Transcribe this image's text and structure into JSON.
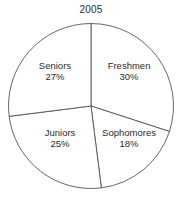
{
  "chart_data": {
    "type": "pie",
    "title": "2005",
    "xlabel": "",
    "ylabel": "",
    "legend": "none",
    "grid": false,
    "start_angle_deg": 0,
    "direction": "clockwise",
    "categories": [
      "Freshmen",
      "Sophomores",
      "Juniors",
      "Seniors"
    ],
    "values": [
      30,
      18,
      25,
      27
    ],
    "value_unit": "%",
    "slices": [
      {
        "label": "Freshmen",
        "value": 30,
        "value_text": "30%",
        "start_deg": 0,
        "end_deg": 108,
        "fill": "#ffffff",
        "stroke": "#555555",
        "label_x_pct": 70.9,
        "label_y_pct": 34.8
      },
      {
        "label": "Sophomores",
        "value": 18,
        "value_text": "18%",
        "start_deg": 108,
        "end_deg": 172.8,
        "fill": "#ffffff",
        "stroke": "#555555",
        "label_x_pct": 70.9,
        "label_y_pct": 67.6
      },
      {
        "label": "Juniors",
        "value": 25,
        "value_text": "25%",
        "start_deg": 172.8,
        "end_deg": 262.8,
        "fill": "#ffffff",
        "stroke": "#555555",
        "label_x_pct": 33.0,
        "label_y_pct": 67.6
      },
      {
        "label": "Seniors",
        "value": 27,
        "value_text": "27%",
        "start_deg": 262.8,
        "end_deg": 360,
        "fill": "#ffffff",
        "stroke": "#555555",
        "label_x_pct": 30.2,
        "label_y_pct": 34.8
      }
    ],
    "geometry": {
      "center_x": 91,
      "center_y": 106,
      "radius": 82.5
    },
    "colors": {
      "background": "#ffffff",
      "outline": "#555555",
      "text": "#2b2b2b"
    }
  }
}
